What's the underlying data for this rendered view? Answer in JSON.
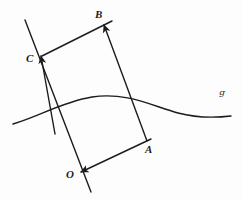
{
  "figure": {
    "background_color": "#fdfdfd",
    "ink_color": "#1c1c1c",
    "stroke_width": 1.4,
    "width": 243,
    "height": 200,
    "labels": {
      "A": "A",
      "B": "B",
      "C": "C",
      "O": "O",
      "curve": "ᵍ"
    },
    "points": {
      "O": {
        "x": 82,
        "y": 172
      },
      "A": {
        "x": 150,
        "y": 140
      },
      "B": {
        "x": 110,
        "y": 22
      },
      "C": {
        "x": 42,
        "y": 56
      }
    },
    "segments": [
      {
        "name": "line-O-to-C-extended",
        "x1": 25,
        "y1": 20,
        "x2": 91,
        "y2": 192,
        "arrow": "none"
      },
      {
        "name": "vector-A-to-B",
        "x1": 147,
        "y1": 141,
        "x2": 104,
        "y2": 25,
        "arrow": "end"
      },
      {
        "name": "vector-O-to-C",
        "x1": 55,
        "y1": 134,
        "x2": 41,
        "y2": 56,
        "arrow": "end"
      },
      {
        "name": "segment-C-to-B",
        "x1": 42,
        "y1": 56,
        "x2": 112,
        "y2": 21,
        "arrow": "none"
      },
      {
        "name": "segment-A-to-O",
        "x1": 151,
        "y1": 139,
        "x2": 81,
        "y2": 172,
        "arrow": "end"
      }
    ],
    "curve": {
      "name": "curve-G",
      "path": "M 13 124 C 40 116 62 102 92 97 C 126 92 150 105 178 113 C 197 118 214 118 231 116",
      "start": {
        "x": 13,
        "y": 124
      },
      "peak": {
        "x": 92,
        "y": 97
      },
      "end": {
        "x": 231,
        "y": 116
      }
    }
  }
}
